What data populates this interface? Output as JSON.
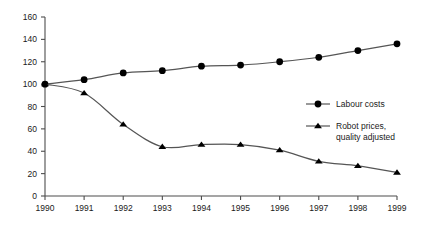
{
  "chart_data": {
    "type": "line",
    "title": "",
    "subtitle": "",
    "xlabel": "",
    "ylabel": "",
    "x": [
      1990,
      1991,
      1992,
      1993,
      1994,
      1995,
      1996,
      1997,
      1998,
      1999
    ],
    "xtick_labels": [
      "1990",
      "1991",
      "1992",
      "1993",
      "1994",
      "1995",
      "1996",
      "1997",
      "1998",
      "1999"
    ],
    "ytick_labels": [
      "0",
      "20",
      "40",
      "60",
      "80",
      "100",
      "120",
      "140",
      "160"
    ],
    "yticks": [
      0,
      20,
      40,
      60,
      80,
      100,
      120,
      140,
      160
    ],
    "ylim": [
      0,
      160
    ],
    "xlim": [
      1990,
      1999
    ],
    "grid": false,
    "legend_position": "center-right",
    "series": [
      {
        "name": "Labour costs",
        "marker": "circle",
        "color": "#000000",
        "values": [
          100,
          104,
          110,
          112,
          116,
          117,
          120,
          124,
          130,
          136
        ]
      },
      {
        "name": "Robot prices, quality adjusted",
        "marker": "triangle",
        "color": "#000000",
        "values": [
          100,
          92,
          64,
          44,
          46,
          46,
          41,
          31,
          27,
          21
        ]
      }
    ]
  },
  "legend": {
    "entries": [
      {
        "label": "Labour costs",
        "label_line2": "",
        "marker": "circle-marker-icon"
      },
      {
        "label": "Robot prices,",
        "label_line2": "quality adjusted",
        "marker": "triangle-marker-icon"
      }
    ]
  },
  "colors": {
    "axis": "#4d4d4d",
    "line": "#555555",
    "marker": "#000000",
    "text": "#1a1a1a",
    "background": "#ffffff"
  }
}
